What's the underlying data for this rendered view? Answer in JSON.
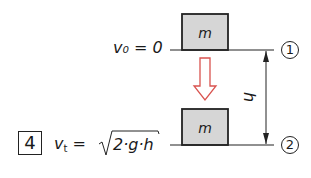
{
  "diagram": {
    "type": "free-fall velocity illustration",
    "number_label": "4",
    "state1": {
      "marker": "1",
      "velocity_label": "v₀ = 0",
      "mass_label": "m"
    },
    "state2": {
      "marker": "2",
      "velocity_label_prefix": "v",
      "velocity_label_subscript": "t",
      "velocity_label_eq": " = ",
      "velocity_label_formula": "2·g·h",
      "mass_label": "m"
    },
    "height_label": "h",
    "fall_arrow": {
      "direction": "down",
      "color": "#d9534f"
    },
    "colors": {
      "mass_fill": "#d6d6d6",
      "lines": "#222222",
      "arrow": "#d9534f"
    }
  }
}
